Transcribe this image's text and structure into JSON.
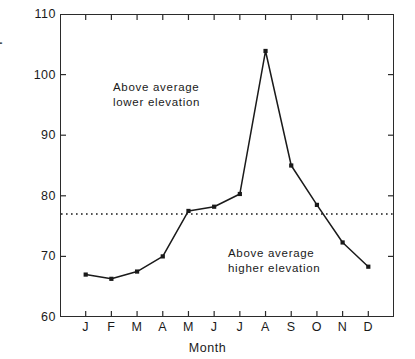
{
  "chart_data": {
    "type": "line",
    "title": "",
    "xlabel": "Month",
    "ylabel": "Precipitation ratio, %",
    "categories": [
      "J",
      "F",
      "M",
      "A",
      "M",
      "J",
      "J",
      "A",
      "S",
      "O",
      "N",
      "D"
    ],
    "category_names": [
      "January",
      "February",
      "March",
      "April",
      "May",
      "June",
      "July",
      "August",
      "September",
      "October",
      "November",
      "December"
    ],
    "values": [
      67.0,
      66.3,
      67.5,
      70.0,
      77.5,
      78.2,
      80.3,
      103.9,
      85.0,
      78.5,
      72.3,
      68.3
    ],
    "ylim": [
      60,
      110
    ],
    "yticks": [
      60,
      70,
      80,
      90,
      100,
      110
    ],
    "ytick_labels": [
      "60",
      "70",
      "80",
      "90",
      "100",
      "110"
    ],
    "xlim": [
      0,
      13
    ],
    "grid": false,
    "legend": false,
    "marker": "square",
    "line_color": "#1a1a1a",
    "reference_line": {
      "value": 77.0,
      "style": "dotted",
      "color": "#1a1a1a"
    },
    "annotations": [
      {
        "text": "Above average\nlower elevation",
        "region": "upper"
      },
      {
        "text": "Above average\nhigher elevation",
        "region": "lower"
      }
    ]
  },
  "figure": {
    "axis_color": "#2b2b2b",
    "background": "#ffffff"
  }
}
